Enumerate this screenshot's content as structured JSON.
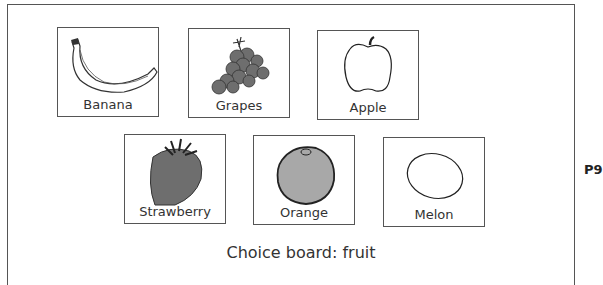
{
  "board": {
    "caption": "Choice board: fruit",
    "page_number": "P9",
    "cards": [
      {
        "label": "Banana",
        "icon": "banana-icon"
      },
      {
        "label": "Grapes",
        "icon": "grapes-icon"
      },
      {
        "label": "Apple",
        "icon": "apple-icon"
      },
      {
        "label": "Strawberry",
        "icon": "strawberry-icon"
      },
      {
        "label": "Orange",
        "icon": "orange-icon"
      },
      {
        "label": "Melon",
        "icon": "melon-icon"
      }
    ]
  },
  "colors": {
    "border": "#555555",
    "text": "#333333",
    "fill_dark": "#6e6e6e",
    "fill_mid": "#9a9a9a"
  }
}
